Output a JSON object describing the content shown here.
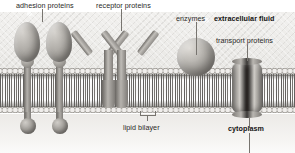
{
  "figure": {
    "labels": {
      "adhesion_proteins": "adhesion proteins",
      "receptor_proteins": "receptor proteins",
      "enzymes": "enzymes",
      "extracellular_fluid": "extracellular fluid",
      "transport_proteins": "transport proteins",
      "lipid_bilayer": "lipid bilayer",
      "cytoplasm": "cytoplasm"
    },
    "emphasis": {
      "extracellular_fluid": "bold",
      "cytoplasm": "bold"
    },
    "colors": {
      "extracellular_background": "#eeedea",
      "cytoplasm_background": "#f2f0ee",
      "lipid_head": "#b9b6b1",
      "lipid_tail": "#3c3a38",
      "protein_fill": "#9a9792",
      "leader_line": "#77746f",
      "text": "#2a2927"
    },
    "structures": [
      {
        "name": "adhesion-protein-1",
        "kind": "oval-stalk",
        "side": "spanning"
      },
      {
        "name": "adhesion-protein-2",
        "kind": "oval-stalk",
        "side": "spanning"
      },
      {
        "name": "receptor-protein-1",
        "kind": "y-shaped",
        "side": "spanning"
      },
      {
        "name": "receptor-protein-2",
        "kind": "y-shaped",
        "side": "spanning"
      },
      {
        "name": "enzyme",
        "kind": "sphere",
        "side": "extracellular-surface"
      },
      {
        "name": "transport-protein",
        "kind": "channel-barrel",
        "side": "spanning"
      }
    ]
  }
}
